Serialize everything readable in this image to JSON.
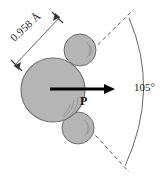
{
  "figure": {
    "background_color": "#ffffff"
  },
  "labels": {
    "bond_length": "0.958 Å",
    "dipole_symbol": "P",
    "bond_angle": "105°"
  },
  "colors": {
    "atom_fill": "#b5b5b5",
    "atom_stroke": "#6e6e6e",
    "shading_stroke": "#8f8f8f",
    "arrow": "#000000",
    "guide_line": "#555555",
    "arc": "#666666",
    "text": "#1a1a1a"
  },
  "atoms": [
    {
      "name": "oxygen",
      "cx": 53,
      "cy": 90,
      "r": 32
    },
    {
      "name": "hydrogen-upper",
      "cx": 80,
      "cy": 50,
      "r": 16
    },
    {
      "name": "hydrogen-lower",
      "cx": 78,
      "cy": 128,
      "r": 16
    }
  ],
  "dipole_vector": {
    "x1": 50,
    "y1": 89,
    "x2": 113,
    "y2": 89,
    "direction": "right"
  },
  "bond_angle_geometry": {
    "vertex_x": 53,
    "vertex_y": 89,
    "value_degrees": 105,
    "upper_ray_end_x": 133,
    "upper_ray_end_y": 10,
    "lower_ray_end_x": 129,
    "lower_ray_end_y": 172,
    "arc_start_x": 129,
    "arc_start_y": 18,
    "arc_end_x": 125,
    "arc_end_y": 166
  },
  "dimension_line": {
    "x1": 16,
    "y1": 64,
    "x2": 60,
    "y2": 18,
    "tick_style": "slash-barb"
  }
}
